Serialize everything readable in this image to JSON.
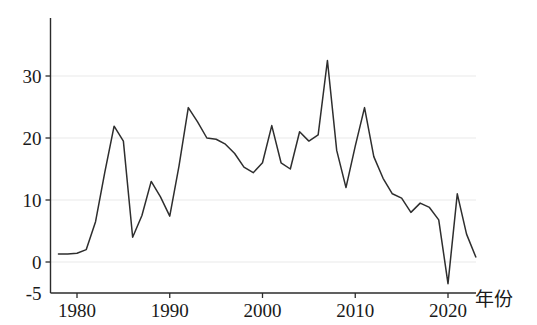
{
  "chart_data": {
    "type": "line",
    "title": "",
    "subtitle": "",
    "xlabel": "年份",
    "ylabel": "",
    "xlim": [
      1977.2,
      2024.5
    ],
    "ylim": [
      -5,
      33.5
    ],
    "grid": true,
    "legend": null,
    "xticks": [
      1980,
      1990,
      2000,
      2010,
      2020
    ],
    "xticklabels": [
      "1980",
      "1990",
      "2000",
      "2010",
      "2020"
    ],
    "yticks": [
      -5,
      0,
      10,
      20,
      30
    ],
    "yticklabels": [
      "-5",
      "0",
      "10",
      "20",
      "30"
    ],
    "gridlines_y": [
      0,
      10,
      20,
      30
    ],
    "line_color": "#2e2e2e",
    "axis_color": "#2b2b2b",
    "grid_color": "#e9e9e9",
    "background_color": "#ffffff",
    "x": [
      1978,
      1979,
      1980,
      1981,
      1982,
      1983,
      1984,
      1985,
      1986,
      1987,
      1988,
      1989,
      1990,
      1991,
      1992,
      1993,
      1994,
      1995,
      1996,
      1997,
      1998,
      1999,
      2000,
      2001,
      2002,
      2003,
      2004,
      2005,
      2006,
      2007,
      2008,
      2009,
      2010,
      2011,
      2012,
      2013,
      2014,
      2015,
      2016,
      2017,
      2018,
      2019,
      2020,
      2021,
      2022,
      2023
    ],
    "values": [
      1.3,
      1.3,
      1.4,
      2.0,
      6.5,
      14.5,
      21.9,
      19.5,
      4.0,
      7.5,
      13.0,
      10.5,
      7.4,
      15.5,
      24.9,
      22.6,
      20.0,
      19.8,
      19.0,
      17.5,
      15.3,
      14.4,
      16.0,
      22.0,
      16.0,
      15.0,
      21.0,
      19.5,
      20.5,
      32.5,
      18.0,
      12.0,
      18.7,
      24.9,
      17.0,
      13.5,
      11.0,
      10.3,
      8.0,
      9.5,
      8.8,
      6.8,
      -3.5,
      11.0,
      4.5,
      0.8
    ],
    "series": [
      {
        "name": "annual-value",
        "values": [
          1.3,
          1.3,
          1.4,
          2.0,
          6.5,
          14.5,
          21.9,
          19.5,
          4.0,
          7.5,
          13.0,
          10.5,
          7.4,
          15.5,
          24.9,
          22.6,
          20.0,
          19.8,
          19.0,
          17.5,
          15.3,
          14.4,
          16.0,
          22.0,
          16.0,
          15.0,
          21.0,
          19.5,
          20.5,
          32.5,
          18.0,
          12.0,
          18.7,
          24.9,
          17.0,
          13.5,
          11.0,
          10.3,
          8.0,
          9.5,
          8.8,
          6.8,
          -3.5,
          11.0,
          4.5,
          0.8
        ]
      }
    ],
    "annotations": []
  },
  "axis": {
    "x_title": "年份",
    "y_title": ""
  }
}
